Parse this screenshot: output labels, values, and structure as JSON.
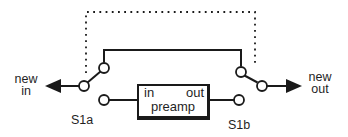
{
  "diagram": {
    "colors": {
      "line": "#1a1a1a",
      "text": "#1f1f1f",
      "background": "#ffffff",
      "contact_fill": "#ffffff"
    },
    "left_port": {
      "line1": "new",
      "line2": "in"
    },
    "right_port": {
      "line1": "new",
      "line2": "out"
    },
    "switch_left": {
      "label": "S1a"
    },
    "switch_right": {
      "label": "S1b"
    },
    "preamp_box": {
      "input_label": "in",
      "output_label": "out",
      "name": "preamp"
    }
  }
}
